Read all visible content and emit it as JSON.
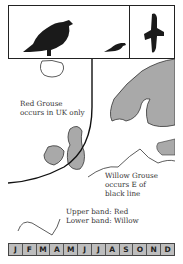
{
  "title_panel": {
    "icons": [
      "grouse-standing-icon",
      "grouse-small-icon",
      "grouse-flying-icon"
    ]
  },
  "map": {
    "red_grouse_note": [
      "Red Grouse",
      "occurs in  UK only"
    ],
    "willow_grouse_note": [
      "Willow Grouse",
      "occurs E of",
      "black line"
    ],
    "legend": [
      "Upper band: Red",
      "Lower band: Willow"
    ],
    "colors": {
      "land_shaded": "#a9a9a9",
      "land_outline": "#333333",
      "range_line": "#111111"
    }
  },
  "months": [
    "J",
    "F",
    "M",
    "A",
    "M",
    "J",
    "J",
    "A",
    "S",
    "O",
    "N",
    "D"
  ]
}
